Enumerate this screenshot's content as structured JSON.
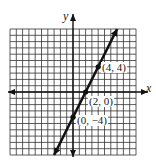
{
  "chart_data": {
    "type": "line",
    "title": "",
    "xlabel": "x",
    "ylabel": "y",
    "xlim": [
      -10,
      10
    ],
    "ylim": [
      -10,
      10
    ],
    "grid": true,
    "series": [
      {
        "name": "y = 2x - 4",
        "x": [
          -3,
          7
        ],
        "y": [
          -10,
          10
        ]
      }
    ],
    "points": [
      {
        "x": 4,
        "y": 4,
        "label": "(4, 4)"
      },
      {
        "x": 2,
        "y": 0,
        "label": "(2, 0)"
      },
      {
        "x": 0,
        "y": -4,
        "label": "(0, -4)"
      }
    ]
  },
  "labels": {
    "x_axis": "x",
    "y_axis": "y",
    "p1": "(4, 4)",
    "p2": "(2, 0)",
    "p3": "(0, −4)"
  }
}
